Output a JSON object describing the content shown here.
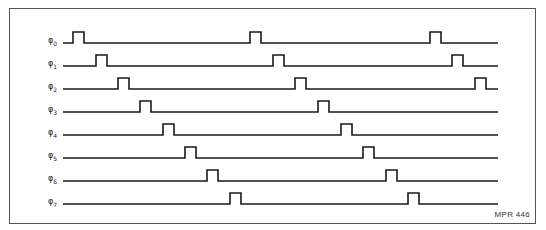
{
  "diagram": {
    "type": "timing-diagram",
    "figure_id": "MPR 446",
    "line_start_x": 63,
    "line_end_x": 498,
    "pulse_width": 11,
    "pulse_height": 11,
    "stroke_color": "#1a1a1a",
    "signals": [
      {
        "name": "φ0",
        "symbol": "φ",
        "index": "0",
        "baseline_y": 43,
        "pulses_x": [
          73,
          250,
          430
        ]
      },
      {
        "name": "φ1",
        "symbol": "φ",
        "index": "1",
        "baseline_y": 66,
        "pulses_x": [
          96,
          273,
          452
        ]
      },
      {
        "name": "φ2",
        "symbol": "φ",
        "index": "2",
        "baseline_y": 89,
        "pulses_x": [
          118,
          295,
          475
        ]
      },
      {
        "name": "φ3",
        "symbol": "φ",
        "index": "3",
        "baseline_y": 112,
        "pulses_x": [
          140,
          318
        ]
      },
      {
        "name": "φ4",
        "symbol": "φ",
        "index": "4",
        "baseline_y": 135,
        "pulses_x": [
          163,
          341
        ]
      },
      {
        "name": "φ5",
        "symbol": "φ",
        "index": "5",
        "baseline_y": 158,
        "pulses_x": [
          185,
          363
        ]
      },
      {
        "name": "φ6",
        "symbol": "φ",
        "index": "6",
        "baseline_y": 181,
        "pulses_x": [
          207,
          386
        ]
      },
      {
        "name": "φ7",
        "symbol": "φ",
        "index": "7",
        "baseline_y": 204,
        "pulses_x": [
          230,
          408
        ]
      }
    ]
  }
}
